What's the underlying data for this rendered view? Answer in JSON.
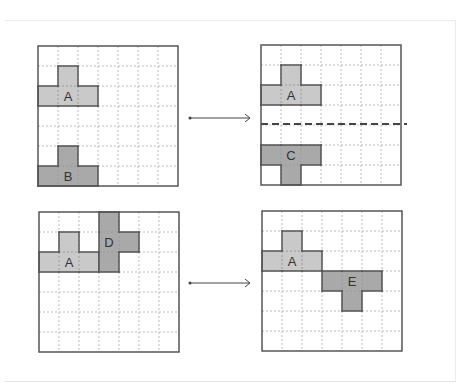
{
  "colors": {
    "grid_border": "#555555",
    "grid_dotted": "#bcbcbc",
    "shape_light": "#c9c9c9",
    "shape_dark": "#a9a9a9",
    "shape_stroke": "#555555",
    "arrow": "#444444",
    "dashed_line": "#444444"
  },
  "grid_size": 7,
  "panels": [
    {
      "id": "top-left",
      "shapes": [
        {
          "label": "A",
          "tone": "light",
          "cells": [
            [
              1,
              1
            ],
            [
              0,
              2
            ],
            [
              1,
              2
            ],
            [
              2,
              2
            ]
          ],
          "label_cell": [
            1,
            2
          ]
        },
        {
          "label": "B",
          "tone": "dark",
          "cells": [
            [
              1,
              5
            ],
            [
              0,
              6
            ],
            [
              1,
              6
            ],
            [
              2,
              6
            ]
          ],
          "label_cell": [
            1,
            6
          ]
        }
      ]
    },
    {
      "id": "top-right",
      "shapes": [
        {
          "label": "A",
          "tone": "light",
          "cells": [
            [
              1,
              1
            ],
            [
              0,
              2
            ],
            [
              1,
              2
            ],
            [
              2,
              2
            ]
          ],
          "label_cell": [
            1,
            2
          ]
        },
        {
          "label": "C",
          "tone": "dark",
          "cells": [
            [
              0,
              5
            ],
            [
              1,
              5
            ],
            [
              2,
              5
            ],
            [
              1,
              6
            ]
          ],
          "label_cell": [
            1,
            5
          ]
        }
      ],
      "dashed_line_row": 4
    },
    {
      "id": "bottom-left",
      "shapes": [
        {
          "label": "A",
          "tone": "light",
          "cells": [
            [
              1,
              1
            ],
            [
              0,
              2
            ],
            [
              1,
              2
            ],
            [
              2,
              2
            ]
          ],
          "label_cell": [
            1,
            2
          ]
        },
        {
          "label": "D",
          "tone": "dark",
          "cells": [
            [
              3,
              0
            ],
            [
              3,
              1
            ],
            [
              3,
              2
            ],
            [
              4,
              1
            ]
          ],
          "label_cell": [
            3,
            1
          ]
        }
      ]
    },
    {
      "id": "bottom-right",
      "shapes": [
        {
          "label": "A",
          "tone": "light",
          "cells": [
            [
              1,
              1
            ],
            [
              0,
              2
            ],
            [
              1,
              2
            ],
            [
              2,
              2
            ]
          ],
          "label_cell": [
            1,
            2
          ]
        },
        {
          "label": "E",
          "tone": "dark",
          "cells": [
            [
              3,
              3
            ],
            [
              4,
              3
            ],
            [
              5,
              3
            ],
            [
              4,
              4
            ]
          ],
          "label_cell": [
            4,
            3
          ]
        }
      ]
    }
  ],
  "arrows": [
    {
      "from": "top-left",
      "to": "top-right"
    },
    {
      "from": "bottom-left",
      "to": "bottom-right"
    }
  ]
}
